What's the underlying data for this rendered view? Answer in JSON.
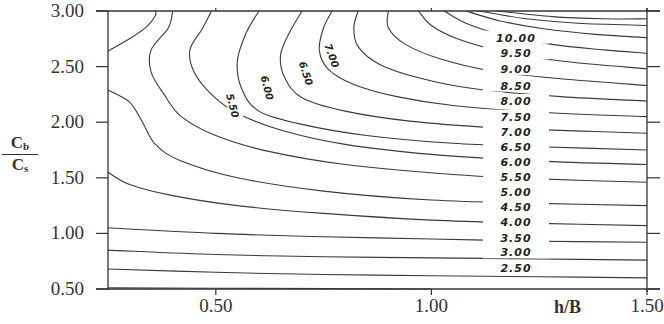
{
  "chart_data": {
    "type": "contour",
    "title": "",
    "xlabel": "h/B",
    "ylabel": {
      "numerator": "C",
      "numerator_sub": "b",
      "denominator": "C",
      "denominator_sub": "s"
    },
    "xlim": [
      0.25,
      1.5
    ],
    "ylim": [
      0.5,
      3.0
    ],
    "x_ticks": [
      "0.50",
      "1.00",
      "1.50"
    ],
    "y_ticks": [
      "3.00",
      "2.50",
      "2.00",
      "1.50",
      "1.00",
      "0.50"
    ],
    "grid": false,
    "contour_levels": [
      "10.00",
      "9.50",
      "9.00",
      "8.50",
      "8.00",
      "7.50",
      "7.00",
      "6.50",
      "6.00",
      "5.50",
      "5.00",
      "4.50",
      "4.00",
      "3.50",
      "3.00",
      "2.50"
    ],
    "right_labels": [
      {
        "text": "10.00",
        "y": 2.76
      },
      {
        "text": "9.50",
        "y": 2.62
      },
      {
        "text": "9.00",
        "y": 2.48
      },
      {
        "text": "8.50",
        "y": 2.33
      },
      {
        "text": "8.00",
        "y": 2.19
      },
      {
        "text": "7.50",
        "y": 2.05
      },
      {
        "text": "7.00",
        "y": 1.91
      },
      {
        "text": "6.50",
        "y": 1.78
      },
      {
        "text": "6.00",
        "y": 1.64
      },
      {
        "text": "5.50",
        "y": 1.51
      },
      {
        "text": "5.00",
        "y": 1.37
      },
      {
        "text": "4.50",
        "y": 1.24
      },
      {
        "text": "4.00",
        "y": 1.1
      },
      {
        "text": "3.50",
        "y": 0.96
      },
      {
        "text": "3.00",
        "y": 0.83
      },
      {
        "text": "2.50",
        "y": 0.69
      }
    ],
    "inline_labels": [
      {
        "text": "5.50",
        "x": 0.54,
        "y": 2.15,
        "rotation": 75
      },
      {
        "text": "6.00",
        "x": 0.62,
        "y": 2.31,
        "rotation": 75
      },
      {
        "text": "6.50",
        "x": 0.71,
        "y": 2.44,
        "rotation": 72
      },
      {
        "text": "7.00",
        "x": 0.77,
        "y": 2.6,
        "rotation": 70
      }
    ],
    "contours": [
      {
        "level": "1.50?",
        "points": [
          [
            0.25,
            2.64
          ],
          [
            0.3,
            2.75
          ],
          [
            0.34,
            2.86
          ],
          [
            0.36,
            2.96
          ],
          [
            0.36,
            3.0
          ]
        ]
      },
      {
        "level": "2.00?",
        "points": [
          [
            0.25,
            2.29
          ],
          [
            0.3,
            2.18
          ],
          [
            0.33,
            2.0
          ],
          [
            0.36,
            1.8
          ],
          [
            0.42,
            1.65
          ],
          [
            0.55,
            1.5
          ],
          [
            0.75,
            1.38
          ],
          [
            1.0,
            1.3
          ],
          [
            1.25,
            1.27
          ],
          [
            1.5,
            1.25
          ]
        ]
      },
      {
        "level": "3.00?",
        "points": [
          [
            0.4,
            3.0
          ],
          [
            0.39,
            2.85
          ],
          [
            0.35,
            2.65
          ],
          [
            0.35,
            2.45
          ],
          [
            0.38,
            2.25
          ],
          [
            0.42,
            2.05
          ],
          [
            0.5,
            1.88
          ],
          [
            0.62,
            1.74
          ],
          [
            0.8,
            1.62
          ],
          [
            1.05,
            1.53
          ],
          [
            1.25,
            1.49
          ],
          [
            1.5,
            1.46
          ]
        ]
      },
      {
        "level": "4.00?",
        "points": [
          [
            0.49,
            3.0
          ],
          [
            0.47,
            2.85
          ],
          [
            0.44,
            2.65
          ],
          [
            0.45,
            2.45
          ],
          [
            0.49,
            2.25
          ],
          [
            0.55,
            2.08
          ],
          [
            0.65,
            1.93
          ],
          [
            0.8,
            1.8
          ],
          [
            1.0,
            1.71
          ],
          [
            1.25,
            1.65
          ],
          [
            1.5,
            1.62
          ]
        ]
      },
      {
        "level": "5.50",
        "points": [
          [
            0.6,
            3.0
          ],
          [
            0.57,
            2.8
          ],
          [
            0.55,
            2.55
          ],
          [
            0.56,
            2.3
          ],
          [
            0.6,
            2.1
          ],
          [
            0.7,
            1.98
          ],
          [
            0.85,
            1.88
          ],
          [
            1.05,
            1.81
          ],
          [
            1.25,
            1.78
          ],
          [
            1.5,
            1.75
          ]
        ]
      },
      {
        "level": "6.00",
        "points": [
          [
            0.7,
            3.0
          ],
          [
            0.67,
            2.8
          ],
          [
            0.65,
            2.6
          ],
          [
            0.66,
            2.4
          ],
          [
            0.7,
            2.22
          ],
          [
            0.8,
            2.1
          ],
          [
            0.95,
            2.01
          ],
          [
            1.15,
            1.95
          ],
          [
            1.35,
            1.92
          ],
          [
            1.5,
            1.9
          ]
        ]
      },
      {
        "level": "6.50",
        "points": [
          [
            0.77,
            3.0
          ],
          [
            0.75,
            2.85
          ],
          [
            0.74,
            2.65
          ],
          [
            0.76,
            2.48
          ],
          [
            0.82,
            2.34
          ],
          [
            0.92,
            2.23
          ],
          [
            1.05,
            2.15
          ],
          [
            1.25,
            2.09
          ],
          [
            1.5,
            2.05
          ]
        ]
      },
      {
        "level": "7.00",
        "points": [
          [
            0.83,
            3.0
          ],
          [
            0.82,
            2.85
          ],
          [
            0.83,
            2.68
          ],
          [
            0.88,
            2.52
          ],
          [
            0.97,
            2.4
          ],
          [
            1.1,
            2.3
          ],
          [
            1.3,
            2.23
          ],
          [
            1.5,
            2.19
          ]
        ]
      },
      {
        "level": "7.50",
        "points": [
          [
            0.9,
            3.0
          ],
          [
            0.9,
            2.85
          ],
          [
            0.94,
            2.7
          ],
          [
            1.02,
            2.57
          ],
          [
            1.14,
            2.46
          ],
          [
            1.3,
            2.39
          ],
          [
            1.5,
            2.33
          ]
        ]
      },
      {
        "level": "8.00",
        "points": [
          [
            0.97,
            3.0
          ],
          [
            1.0,
            2.87
          ],
          [
            1.06,
            2.75
          ],
          [
            1.16,
            2.64
          ],
          [
            1.3,
            2.55
          ],
          [
            1.5,
            2.48
          ]
        ]
      },
      {
        "level": "8.50",
        "points": [
          [
            1.03,
            3.0
          ],
          [
            1.08,
            2.89
          ],
          [
            1.16,
            2.79
          ],
          [
            1.28,
            2.7
          ],
          [
            1.4,
            2.65
          ],
          [
            1.5,
            2.62
          ]
        ]
      },
      {
        "level": "9.00",
        "points": [
          [
            1.08,
            3.0
          ],
          [
            1.16,
            2.91
          ],
          [
            1.26,
            2.84
          ],
          [
            1.38,
            2.79
          ],
          [
            1.5,
            2.76
          ]
        ]
      },
      {
        "level": "9.50",
        "points": [
          [
            1.11,
            3.0
          ],
          [
            1.22,
            2.93
          ],
          [
            1.34,
            2.89
          ],
          [
            1.5,
            2.87
          ]
        ]
      },
      {
        "level": "10.00",
        "points": [
          [
            1.15,
            3.0
          ],
          [
            1.28,
            2.95
          ],
          [
            1.4,
            2.93
          ],
          [
            1.5,
            2.93
          ]
        ]
      },
      {
        "level": "low-1",
        "points": [
          [
            0.25,
            1.55
          ],
          [
            0.3,
            1.44
          ],
          [
            0.4,
            1.34
          ],
          [
            0.55,
            1.25
          ],
          [
            0.75,
            1.18
          ],
          [
            1.0,
            1.12
          ],
          [
            1.25,
            1.09
          ],
          [
            1.5,
            1.07
          ]
        ]
      },
      {
        "level": "low-2",
        "points": [
          [
            0.25,
            1.05
          ],
          [
            0.5,
            1.0
          ],
          [
            0.75,
            0.97
          ],
          [
            1.0,
            0.95
          ],
          [
            1.25,
            0.93
          ],
          [
            1.5,
            0.92
          ]
        ]
      },
      {
        "level": "low-3",
        "points": [
          [
            0.25,
            0.85
          ],
          [
            0.5,
            0.81
          ],
          [
            0.75,
            0.79
          ],
          [
            1.0,
            0.78
          ],
          [
            1.25,
            0.77
          ],
          [
            1.5,
            0.76
          ]
        ]
      },
      {
        "level": "low-4",
        "points": [
          [
            0.25,
            0.68
          ],
          [
            0.5,
            0.65
          ],
          [
            0.75,
            0.63
          ],
          [
            1.0,
            0.62
          ],
          [
            1.25,
            0.61
          ],
          [
            1.5,
            0.6
          ]
        ]
      },
      {
        "level": "low-5",
        "points": [
          [
            0.25,
            0.51
          ],
          [
            0.6,
            0.505
          ],
          [
            1.0,
            0.5
          ]
        ]
      }
    ]
  }
}
